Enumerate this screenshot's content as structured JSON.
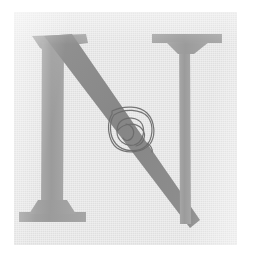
{
  "page": {
    "kind": "scanned-page-crop",
    "width_px": 254,
    "height_px": 259,
    "margin_color": "#ffffff",
    "caption": "Scanned page fragment: large serif capital letter N with a hand-drawn circled annotation"
  },
  "panel": {
    "name": "scanned-paper-panel",
    "background_color": "#e3e3e3",
    "border_color": "#dcdcdc",
    "left_px": 14,
    "top_px": 12,
    "width_px": 223,
    "height_px": 233,
    "texture": "halftone-newsprint"
  },
  "glyph": {
    "character": "N",
    "style": "serif-capital",
    "stem_color": "#a0a0a0",
    "diagonal_color": "#8c8c8c",
    "left_stem_x_px": 48,
    "right_stem_x_px": 186,
    "cap_top_px": 30,
    "baseline_px": 222
  },
  "annotation": {
    "name": "hand-drawn-circle-mark",
    "shape": "rounded-square-with-inner-loops",
    "ink_color": "#6b6b6b",
    "center_x_px": 126,
    "center_y_px": 121,
    "size_px": 34,
    "stroke_width_px": 1.2,
    "loop_count": 3
  }
}
